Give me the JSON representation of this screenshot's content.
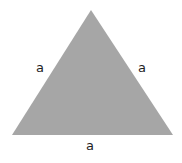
{
  "diagram": {
    "shape": "equilateral-triangle",
    "fill_color": "#a6a6a6",
    "vertices": [
      [
        91,
        10
      ],
      [
        12,
        135
      ],
      [
        173,
        135
      ]
    ],
    "labels": {
      "left_side": "a",
      "right_side": "a",
      "bottom_side": "a"
    }
  }
}
